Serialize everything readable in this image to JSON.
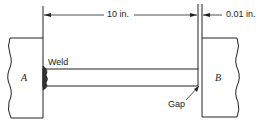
{
  "diagram": {
    "dimension_length": "10 in.",
    "dimension_gap": "0.01 in.",
    "labels": {
      "block_a": "A",
      "block_b": "B",
      "weld": "Weld",
      "gap": "Gap"
    },
    "colors": {
      "stroke": "#222222",
      "background": "#ffffff"
    }
  }
}
